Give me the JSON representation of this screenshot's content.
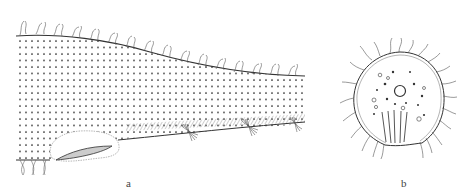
{
  "figure": {
    "panels": [
      {
        "id": "a",
        "label": "a",
        "description": "Lateral view of elongated body with dotted surface, hairy dorsal margin, ventral hatched band with setal tufts and oval organ at lower left"
      },
      {
        "id": "b",
        "label": "b",
        "description": "Round cross-section with peripheral hairs, central circular structure, scattered granules and vertical striations"
      }
    ],
    "colors": {
      "ink": "#333333",
      "dots": "#222222",
      "hatch": "#888888",
      "background": "#ffffff"
    }
  }
}
